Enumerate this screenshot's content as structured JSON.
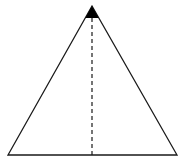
{
  "diagram": {
    "type": "triangle-with-altitude",
    "background": "#ffffff",
    "stroke_color": "#1a1a1a",
    "fill_color": "#000000",
    "apex": [
      92,
      6
    ],
    "base_left": [
      8,
      155
    ],
    "base_right": [
      177,
      155
    ],
    "apex_marker": {
      "shape": "filled-triangle",
      "bottom_y": 18
    },
    "altitude": {
      "style": "dashed",
      "x": 92,
      "y_start": 18,
      "y_end": 155
    }
  }
}
